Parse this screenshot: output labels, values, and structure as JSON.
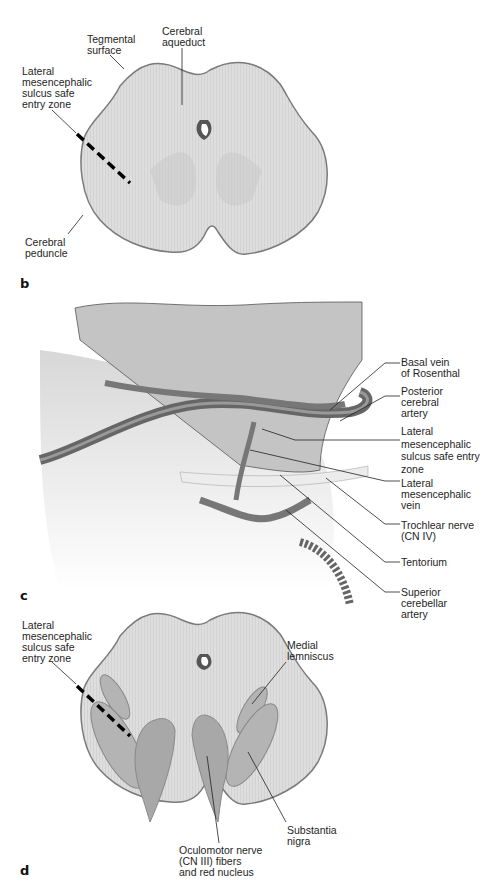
{
  "figure": {
    "panels": [
      {
        "letter": "b",
        "labels": {
          "tegmental_surface": "Tegmental\nsurface",
          "cerebral_aqueduct": "Cerebral\naqueduct",
          "lmsz": "Lateral\nmesencephalic\nsulcus safe\nentry zone",
          "cerebral_peduncle": "Cerebral\npeduncle"
        }
      },
      {
        "letter": "c",
        "labels": {
          "basal_vein": "Basal vein\nof Rosenthal",
          "pca": "Posterior\ncerebral\nartery",
          "lmsz": "Lateral\nmesencephalic\nsulcus safe entry\nzone",
          "lmv": "Lateral\nmesencephalic\nvein",
          "trochlear": "Trochlear nerve\n(CN IV)",
          "tentorium": "Tentorium",
          "sca": "Superior\ncerebellar\nartery"
        }
      },
      {
        "letter": "d",
        "labels": {
          "lmsz": "Lateral\nmesencephalic\nsulcus safe\nentry zone",
          "medial_lemniscus": "Medial\nlemniscus",
          "substantia_nigra": "Substantia\nnigra",
          "oculomotor": "Oculomotor nerve\n(CN III) fibers\nand red nucleus"
        }
      }
    ]
  },
  "colors": {
    "tissue_fill": "#dcdcdc",
    "tissue_outline": "#7a7a7a",
    "structure_fill": "#b4b4b4",
    "vessel": "#6e6e6e",
    "dash": "#000000"
  }
}
